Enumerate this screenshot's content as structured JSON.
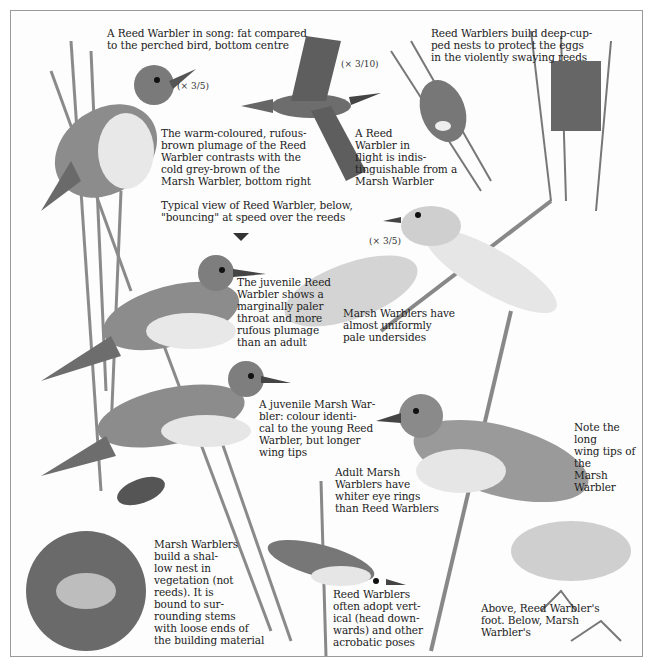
{
  "plate": {
    "subject": "Reed Warbler and Marsh Warbler identification plate",
    "captions": {
      "song": "A Reed Warbler in song: fat compared\nto the perched bird, bottom centre",
      "flight": "A Reed\nWarbler in\nflight is indis-\ntinguishable from a\nMarsh Warbler",
      "nests": "Reed Warblers build deep-cup-\nped nests to protect the eggs\nin the violently swaying reeds",
      "plumage": "The warm-coloured, rufous-\nbrown plumage of the Reed\nWarbler contrasts with the\ncold grey-brown of the\nMarsh Warbler, bottom right",
      "bouncing": "Typical view of Reed Warbler, below,\n\"bouncing\" at speed over the reeds",
      "juvenile_reed": "The juvenile Reed\nWarbler shows a\nmarginally paler\nthroat and more\nrufous plumage\nthan an adult",
      "marsh_undersides": "Marsh Warblers have\nalmost uniformly\npale undersides",
      "juvenile_marsh": "A juvenile Marsh War-\nbler: colour identi-\ncal to the young Reed\nWarbler, but longer\nwing tips",
      "wing_tips": "Note the long\nwing tips of the\nMarsh Warbler",
      "eye_rings": "Adult Marsh\nWarblers have\nwhiter eye rings\nthan Reed Warblers",
      "marsh_nest": "Marsh Warblers\nbuild a shal-\nlow nest in\nvegetation (not\nreeds). It is\nbound to sur-\nrounding stems\nwith loose ends of\nthe building material",
      "acrobatic": "Reed Warblers\noften adopt vert-\nical (head down-\nwards) and other\nacrobatic poses",
      "feet": "Above, Reed Warbler's\nfoot. Below, Marsh\nWarbler's"
    },
    "scales": {
      "song_bird": "(× 3/5)",
      "flight_bird": "(× 3/10)",
      "marsh_bird": "(× 3/5)"
    },
    "colors": {
      "ink": "#222222",
      "border": "#9a9a9a",
      "bird_dark": "#555555",
      "bird_light": "#e6e6e6",
      "foliage": "#bdbdbd"
    }
  }
}
